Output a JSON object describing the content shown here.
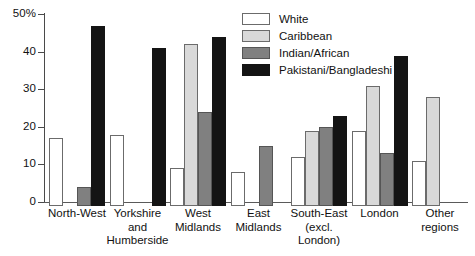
{
  "chart_data": {
    "type": "bar",
    "title": "",
    "xlabel": "",
    "ylabel": "",
    "ylim": [
      0,
      50
    ],
    "yticks": [
      0,
      10,
      20,
      30,
      40,
      50
    ],
    "ytick_labels": [
      "0",
      "10",
      "20",
      "30",
      "40",
      "50%"
    ],
    "grid": false,
    "legend_position": "top-right",
    "categories": [
      "North-West",
      "Yorkshire and Humberside",
      "West Midlands",
      "East Midlands",
      "South-East (excl. London)",
      "London",
      "Other regions"
    ],
    "category_lines": [
      [
        "North-West"
      ],
      [
        "Yorkshire",
        "and",
        "Humberside"
      ],
      [
        "West",
        "Midlands"
      ],
      [
        "East",
        "Midlands"
      ],
      [
        "South-East",
        "(excl.",
        "London)"
      ],
      [
        "London"
      ],
      [
        "Other",
        "regions"
      ]
    ],
    "series": [
      {
        "name": "White",
        "color": "#ffffff",
        "values": [
          18,
          19,
          10,
          9,
          13,
          20,
          12
        ]
      },
      {
        "name": "Caribbean",
        "color": "#d9d9d9",
        "values": [
          0,
          0,
          43,
          0,
          20,
          32,
          29
        ]
      },
      {
        "name": "Indian/African",
        "color": "#808080",
        "values": [
          5,
          0,
          25,
          16,
          21,
          14,
          0
        ]
      },
      {
        "name": "Pakistani/Bangladeshi",
        "color": "#141414",
        "values": [
          48,
          42,
          45,
          0,
          24,
          40,
          0
        ]
      }
    ]
  },
  "legend": {
    "items": [
      {
        "label": "White"
      },
      {
        "label": "Caribbean"
      },
      {
        "label": "Indian/African"
      },
      {
        "label": "Pakistani/Bangladeshi"
      }
    ]
  }
}
